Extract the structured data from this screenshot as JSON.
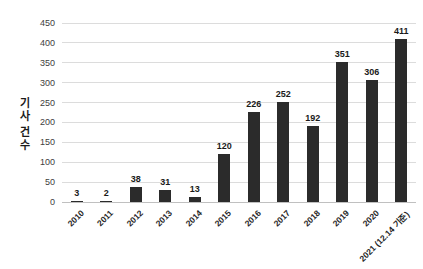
{
  "chart_data": {
    "type": "bar",
    "title": "",
    "xlabel": "",
    "ylabel": "기사 건수",
    "categories": [
      "2010",
      "2011",
      "2012",
      "2013",
      "2014",
      "2015",
      "2016",
      "2017",
      "2018",
      "2019",
      "2020",
      "2021 (12.14 기준)"
    ],
    "values": [
      3,
      2,
      38,
      31,
      13,
      120,
      226,
      252,
      192,
      351,
      306,
      411
    ],
    "ylim": [
      0,
      450
    ],
    "ytick_step": 50,
    "yticks": [
      0,
      50,
      100,
      150,
      200,
      250,
      300,
      350,
      400,
      450
    ],
    "grid": "horizontal",
    "legend": "none",
    "bar_color": "#2b2b2b",
    "gridline_color": "#dcdcdc",
    "axis_line_color": "#c0c0c0",
    "tick_label_color": "#404040",
    "value_label_color": "#1a1a1a"
  }
}
